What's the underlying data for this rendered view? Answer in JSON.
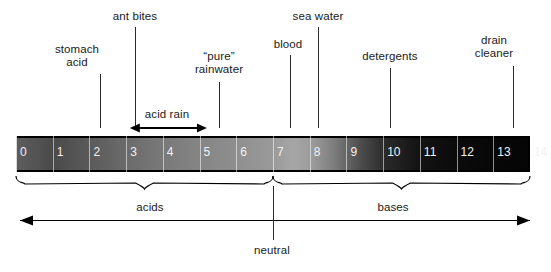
{
  "diagram": {
    "bar": {
      "min": 0,
      "max": 14,
      "ticks": [
        "0",
        "1",
        "2",
        "3",
        "4",
        "5",
        "6",
        "7",
        "8",
        "9",
        "10",
        "11",
        "12",
        "13",
        "14"
      ]
    },
    "substance_labels": [
      {
        "name": "stomach-acid",
        "text": "stomach\nacid",
        "ph": 1.0,
        "label_x": 77,
        "label_y": 43,
        "leader_x": 100,
        "leader_top": 74,
        "leader_h": 54
      },
      {
        "name": "ant-bites",
        "text": "ant bites",
        "ph": 3.0,
        "label_x": 135,
        "label_y": 10,
        "leader_x": 135,
        "leader_top": 27,
        "leader_h": 101
      },
      {
        "name": "pure-rainwater",
        "text": "“pure”\nrainwater",
        "ph": 5.5,
        "label_x": 219,
        "label_y": 50,
        "leader_x": 219,
        "leader_top": 82,
        "leader_h": 46
      },
      {
        "name": "blood",
        "text": "blood",
        "ph": 7.4,
        "label_x": 288,
        "label_y": 38,
        "leader_x": 290,
        "leader_top": 55,
        "leader_h": 73
      },
      {
        "name": "sea-water",
        "text": "sea water",
        "ph": 8.2,
        "label_x": 318,
        "label_y": 10,
        "leader_x": 318,
        "leader_top": 27,
        "leader_h": 101
      },
      {
        "name": "detergents",
        "text": "detergents",
        "ph": 10.2,
        "label_x": 390,
        "label_y": 50,
        "leader_x": 390,
        "leader_top": 68,
        "leader_h": 60
      },
      {
        "name": "drain-cleaner",
        "text": "drain\ncleaner",
        "ph": 13.6,
        "label_x": 494,
        "label_y": 34,
        "leader_x": 513,
        "leader_top": 66,
        "leader_h": 62
      }
    ],
    "acid_rain": {
      "label": "acid rain",
      "label_x": 167,
      "label_y": 108,
      "from_ph": 3.1,
      "to_ph": 5.2
    },
    "regions": [
      {
        "name": "acids",
        "label": "acids",
        "from_ph": 0,
        "to_ph": 7,
        "label_x": 150,
        "label_y": 201
      },
      {
        "name": "bases",
        "label": "bases",
        "from_ph": 7,
        "to_ph": 14,
        "label_x": 393,
        "label_y": 201
      }
    ],
    "neutral": {
      "label": "neutral",
      "ph": 7,
      "label_x": 272,
      "label_y": 244
    },
    "colors": {
      "ink": "#000000",
      "text": "#1a1a1a",
      "bar_number": "#f2f2f2",
      "bar_acid_end": "#5d5d5d",
      "bar_mid_light": "#a6a6a6",
      "bar_base_end": "#050505",
      "background": "#ffffff"
    }
  }
}
